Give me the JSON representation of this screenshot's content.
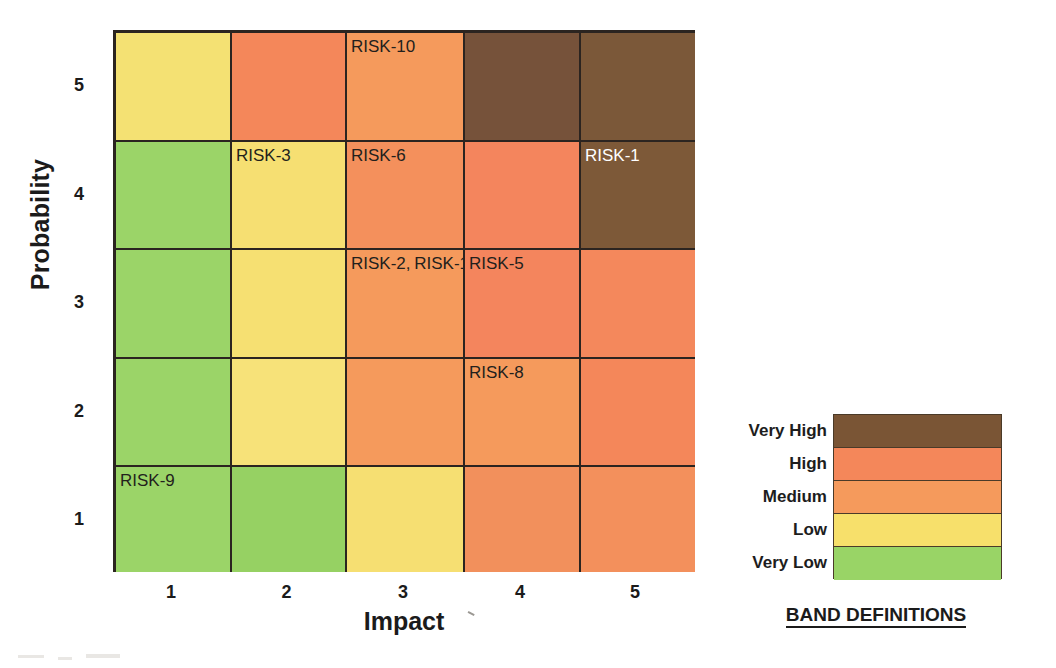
{
  "axes": {
    "y_title": "Probability",
    "x_title": "Impact",
    "y_ticks": [
      "5",
      "4",
      "3",
      "2",
      "1"
    ],
    "x_ticks": [
      "1",
      "2",
      "3",
      "4",
      "5"
    ]
  },
  "legend": {
    "caption": "BAND DEFINITIONS",
    "bands": [
      {
        "label": "Very High",
        "color": "#7a5535"
      },
      {
        "label": "High",
        "color": "#f4875a"
      },
      {
        "label": "Medium",
        "color": "#f59a5c"
      },
      {
        "label": "Low",
        "color": "#f7e06b"
      },
      {
        "label": "Very Low",
        "color": "#99d466"
      }
    ]
  },
  "chart_data": {
    "type": "heatmap",
    "title": "",
    "xlabel": "Impact",
    "ylabel": "Probability",
    "x": [
      1,
      2,
      3,
      4,
      5
    ],
    "y": [
      1,
      2,
      3,
      4,
      5
    ],
    "xlim": [
      0.5,
      5.5
    ],
    "ylim": [
      0.5,
      5.5
    ],
    "grid": true,
    "legend_position": "right",
    "band_levels": [
      "Very Low",
      "Low",
      "Medium",
      "High",
      "Very High"
    ],
    "band_colors": [
      "#99d466",
      "#f7e06b",
      "#f59a5c",
      "#f4875a",
      "#7a5535"
    ],
    "rows": [
      {
        "probability": 5,
        "cells": [
          {
            "impact": 1,
            "color": "#f4e173",
            "band": "Low",
            "label": "",
            "label_color": "dark"
          },
          {
            "impact": 2,
            "color": "#f4875a",
            "band": "High",
            "label": "",
            "label_color": "dark"
          },
          {
            "impact": 3,
            "color": "#f59a5c",
            "band": "Medium",
            "label": "RISK-10",
            "label_color": "dark"
          },
          {
            "impact": 4,
            "color": "#76523a",
            "band": "Very High",
            "label": "",
            "label_color": "dark"
          },
          {
            "impact": 5,
            "color": "#7b5839",
            "band": "Very High",
            "label": "",
            "label_color": "dark"
          }
        ]
      },
      {
        "probability": 4,
        "cells": [
          {
            "impact": 1,
            "color": "#9bd468",
            "band": "Very Low",
            "label": "",
            "label_color": "dark"
          },
          {
            "impact": 2,
            "color": "#f6df72",
            "band": "Low",
            "label": "RISK-3",
            "label_color": "dark"
          },
          {
            "impact": 3,
            "color": "#f4905c",
            "band": "Medium",
            "label": "RISK-6",
            "label_color": "dark"
          },
          {
            "impact": 4,
            "color": "#f4855d",
            "band": "High",
            "label": "",
            "label_color": "dark"
          },
          {
            "impact": 5,
            "color": "#7d5938",
            "band": "Very High",
            "label": "RISK-1",
            "label_color": "light"
          }
        ]
      },
      {
        "probability": 3,
        "cells": [
          {
            "impact": 1,
            "color": "#9bd468",
            "band": "Very Low",
            "label": "",
            "label_color": "dark"
          },
          {
            "impact": 2,
            "color": "#f6e072",
            "band": "Low",
            "label": "",
            "label_color": "dark"
          },
          {
            "impact": 3,
            "color": "#f59a5c",
            "band": "Medium",
            "label": "RISK-2, RISK-11",
            "label_color": "dark"
          },
          {
            "impact": 4,
            "color": "#f4855d",
            "band": "High",
            "label": "RISK-5",
            "label_color": "dark"
          },
          {
            "impact": 5,
            "color": "#f4885c",
            "band": "High",
            "label": "",
            "label_color": "dark"
          }
        ]
      },
      {
        "probability": 2,
        "cells": [
          {
            "impact": 1,
            "color": "#9bd468",
            "band": "Very Low",
            "label": "",
            "label_color": "dark"
          },
          {
            "impact": 2,
            "color": "#f7e279",
            "band": "Low",
            "label": "",
            "label_color": "dark"
          },
          {
            "impact": 3,
            "color": "#f59a5c",
            "band": "Medium",
            "label": "",
            "label_color": "dark"
          },
          {
            "impact": 4,
            "color": "#f59a5c",
            "band": "Medium",
            "label": "RISK-8",
            "label_color": "dark"
          },
          {
            "impact": 5,
            "color": "#f4875a",
            "band": "High",
            "label": "",
            "label_color": "dark"
          }
        ]
      },
      {
        "probability": 1,
        "cells": [
          {
            "impact": 1,
            "color": "#9bd468",
            "band": "Very Low",
            "label": "RISK-9",
            "label_color": "dark"
          },
          {
            "impact": 2,
            "color": "#96d163",
            "band": "Very Low",
            "label": "",
            "label_color": "dark"
          },
          {
            "impact": 3,
            "color": "#f6df72",
            "band": "Low",
            "label": "",
            "label_color": "dark"
          },
          {
            "impact": 4,
            "color": "#f2905c",
            "band": "Medium",
            "label": "",
            "label_color": "dark"
          },
          {
            "impact": 5,
            "color": "#f3905c",
            "band": "Medium",
            "label": "",
            "label_color": "dark"
          }
        ]
      }
    ],
    "risk_placements": [
      {
        "id": "RISK-1",
        "impact": 5,
        "probability": 4
      },
      {
        "id": "RISK-2",
        "impact": 3,
        "probability": 3
      },
      {
        "id": "RISK-3",
        "impact": 2,
        "probability": 4
      },
      {
        "id": "RISK-5",
        "impact": 4,
        "probability": 3
      },
      {
        "id": "RISK-6",
        "impact": 3,
        "probability": 4
      },
      {
        "id": "RISK-8",
        "impact": 4,
        "probability": 2
      },
      {
        "id": "RISK-9",
        "impact": 1,
        "probability": 1
      },
      {
        "id": "RISK-10",
        "impact": 3,
        "probability": 5
      },
      {
        "id": "RISK-11",
        "impact": 3,
        "probability": 3
      }
    ]
  }
}
